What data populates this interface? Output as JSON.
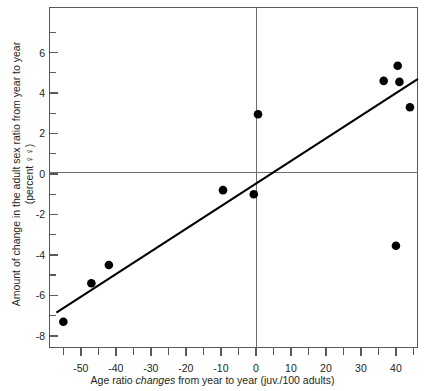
{
  "chart_data": {
    "type": "scatter",
    "title": "",
    "xlabel": "Age ratio changes from year to year (juv./100 adults)",
    "xlabel_parts": {
      "before": "Age ratio ",
      "italic": "changes",
      "after": " from year to year (juv./100 adults)"
    },
    "ylabel": "Amount of change in the adult sex ratio from year to year",
    "ylabel_line2": "(percent ♀♀)",
    "xlim": [
      -59.1,
      46.3
    ],
    "ylim": [
      -8.6,
      8.25
    ],
    "xticks_major": [
      -50,
      -40,
      -30,
      -20,
      -10,
      0,
      10,
      20,
      30,
      40
    ],
    "xtick_labels": [
      "-50",
      "-40",
      "-30",
      "-20",
      "-10",
      "0",
      "10",
      "20",
      "30",
      "40"
    ],
    "xticks_minor": [
      -55,
      -45,
      -35,
      -25,
      -15,
      -5,
      5,
      15,
      25,
      35,
      45
    ],
    "yticks_major": [
      -8,
      -6,
      -4,
      -2,
      0,
      2,
      4,
      6
    ],
    "ytick_labels": [
      "-8",
      "-6",
      "-4",
      "-2",
      "0",
      "2",
      "4",
      "6"
    ],
    "yticks_minor": [
      -7,
      -5,
      -3,
      -1,
      1,
      3,
      5,
      7
    ],
    "grid": false,
    "zero_lines": true,
    "legend": "none",
    "points": [
      {
        "x": -55.0,
        "y": -7.3
      },
      {
        "x": -47.0,
        "y": -5.4
      },
      {
        "x": -42.0,
        "y": -4.5
      },
      {
        "x": -9.4,
        "y": -0.8
      },
      {
        "x": -0.6,
        "y": -1.0
      },
      {
        "x": 0.6,
        "y": 2.95
      },
      {
        "x": 36.5,
        "y": 4.6
      },
      {
        "x": 40.5,
        "y": 5.35
      },
      {
        "x": 41.0,
        "y": 4.55
      },
      {
        "x": 44.0,
        "y": 3.3
      },
      {
        "x": 40.0,
        "y": -3.55
      }
    ],
    "fit_line": {
      "type": "linear",
      "x1": -57.0,
      "y1": -6.85,
      "x2": 46.3,
      "y2": 4.7
    },
    "point_color": "#000000",
    "line_color": "#000000",
    "frame_color": "#58595b"
  }
}
